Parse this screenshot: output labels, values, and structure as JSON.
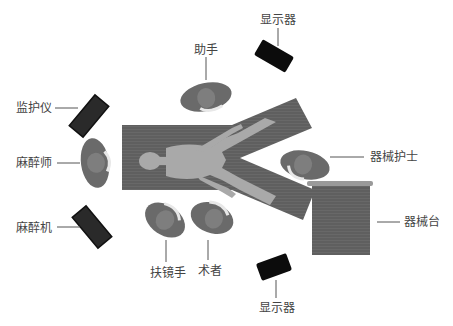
{
  "diagram": {
    "title": "",
    "type": "operating-room-layout",
    "colors": {
      "table": "#5f5f5f",
      "body": "#a9a9a9",
      "staff": "#6a6a6a",
      "staff_head": "#8a8a8a",
      "device_dark": "#222222",
      "device_black": "#0c0c0c",
      "instrument_table": "#6b6b6b",
      "instrument_table_top": "#9a9a9a",
      "leader_line": "#555555"
    },
    "labels": {
      "display_top": "显示器",
      "assistant": "助手",
      "monitor": "监护仪",
      "anesthesiologist": "麻醉师",
      "scrub_nurse": "器械护士",
      "anesthesia_machine": "麻醉机",
      "instrument_table": "器械台",
      "scope_holder": "扶镜手",
      "surgeon": "术者",
      "display_bottom": "显示器"
    }
  }
}
